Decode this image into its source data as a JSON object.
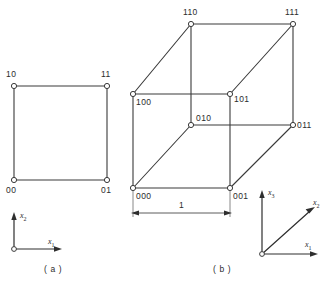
{
  "figure": {
    "panels": [
      {
        "caption": "( a )",
        "kind": "square",
        "vertex_labels": [
          "10",
          "11",
          "00",
          "01"
        ],
        "axes": [
          {
            "name": "x2",
            "base": "x",
            "sub": "2"
          },
          {
            "name": "x1",
            "base": "x",
            "sub": "1"
          }
        ]
      },
      {
        "caption": "( b )",
        "kind": "cube",
        "vertex_labels": [
          "110",
          "111",
          "100",
          "101",
          "010",
          "011",
          "000",
          "001"
        ],
        "dimension_label": "1",
        "axes": [
          {
            "name": "x3",
            "base": "x",
            "sub": "3"
          },
          {
            "name": "x2",
            "base": "x",
            "sub": "2"
          },
          {
            "name": "x1",
            "base": "x",
            "sub": "1"
          }
        ]
      }
    ],
    "square_vertices": {
      "top_left": "10",
      "top_right": "11",
      "bottom_left": "00",
      "bottom_right": "01"
    },
    "cube_vertices": {
      "top_back_left": "110",
      "top_back_right": "111",
      "top_front_left": "100",
      "top_front_right": "101",
      "bottom_back_left": "010",
      "bottom_back_right": "011",
      "bottom_front_left": "000",
      "bottom_front_right": "001"
    },
    "dimension": {
      "value": "1"
    },
    "axis_labels": {
      "x1": "x",
      "x1_sub": "1",
      "x2": "x",
      "x2_sub": "2",
      "x3": "x",
      "x3_sub": "3"
    },
    "captions": {
      "a": "( a )",
      "b": "( b )"
    },
    "colors": {
      "line": "#3a3a3a",
      "text": "#2b2b2b",
      "background": "#ffffff"
    }
  }
}
